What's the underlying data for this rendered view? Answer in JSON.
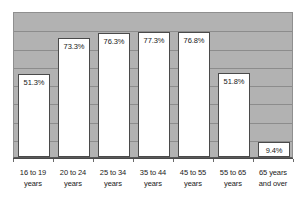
{
  "chart_data": {
    "type": "bar",
    "title": "",
    "subtitle": "",
    "xlabel": "",
    "ylabel": "",
    "categories": [
      "16 to 19 years",
      "20 to 24 years",
      "25 to 34 years",
      "35 to 44 years",
      "45 to 55 years",
      "55 to 65 years",
      "65 years and over"
    ],
    "category_lines": [
      [
        "16 to 19",
        "years"
      ],
      [
        "20 to 24",
        "years"
      ],
      [
        "25 to 34",
        "years"
      ],
      [
        "35 to 44",
        "years"
      ],
      [
        "45 to 55",
        "years"
      ],
      [
        "55 to 65",
        "years"
      ],
      [
        "65 years",
        "and over"
      ]
    ],
    "values": [
      51.3,
      73.3,
      76.3,
      77.3,
      76.8,
      51.8,
      9.4
    ],
    "value_labels": [
      "51.3%",
      "73.3%",
      "76.3%",
      "77.3%",
      "76.8%",
      "51.8%",
      "9.4%"
    ],
    "ylim": [
      0,
      90
    ],
    "ytick_labels": [],
    "grid": true,
    "gridline_count": 8,
    "legend": false,
    "legend_position": "none",
    "colors": {
      "plot_background": "#b2b2b2",
      "bar_fill": "#ffffff",
      "bar_border": "#4a4a4a",
      "gridline": "#8c8c8c",
      "axis": "#4a4a4a",
      "text": "#1a1a1a",
      "page_background": "#ffffff"
    }
  }
}
